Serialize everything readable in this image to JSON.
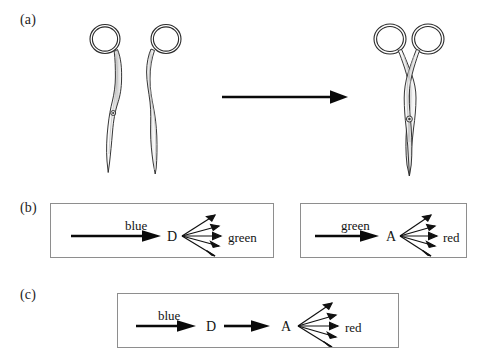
{
  "figure": {
    "background_color": "#ffffff",
    "ink_color": "#141414",
    "box_border_color": "#8e8e8e"
  },
  "panels": [
    {
      "id": "a",
      "label": "(a)",
      "description": "Two separated scissor halves transform into one assembled pair of scissors",
      "arrow": {
        "name": "transform-arrow",
        "direction": "right"
      },
      "items": [
        {
          "name": "scissor-half-left",
          "label": "scissor blade half"
        },
        {
          "name": "scissor-half-right",
          "label": "scissor blade half"
        },
        {
          "name": "scissors-assembled",
          "label": "assembled scissors"
        }
      ]
    },
    {
      "id": "b",
      "label": "(b)",
      "boxes": [
        {
          "name": "donor-box",
          "input_label": "blue",
          "node_label": "D",
          "output_label": "green",
          "fan_arrow_count": 5
        },
        {
          "name": "acceptor-box",
          "input_label": "green",
          "node_label": "A",
          "output_label": "red",
          "fan_arrow_count": 5
        }
      ]
    },
    {
      "id": "c",
      "label": "(c)",
      "boxes": [
        {
          "name": "donor-acceptor-box",
          "input_label": "blue",
          "node_label_first": "D",
          "node_label_second": "A",
          "output_label": "red",
          "fan_arrow_count": 5
        }
      ]
    }
  ]
}
